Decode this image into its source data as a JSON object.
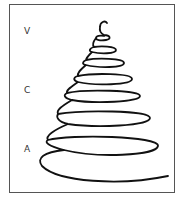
{
  "diagram": {
    "type": "conical-spiral",
    "labels": [
      {
        "text": "V",
        "x": 24,
        "y": 26
      },
      {
        "text": "C",
        "x": 24,
        "y": 85
      },
      {
        "text": "A",
        "x": 24,
        "y": 144
      }
    ],
    "colors": {
      "stroke": "#111111",
      "frame": "#555555",
      "background": "#ffffff"
    }
  }
}
